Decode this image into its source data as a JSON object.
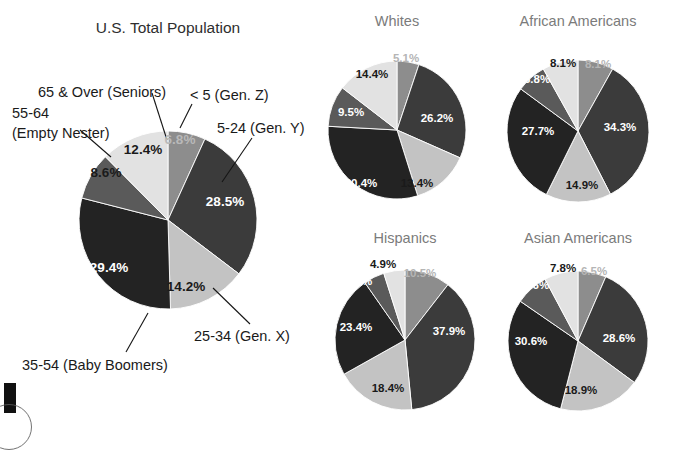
{
  "figure": {
    "kind": "pie-chart-panel",
    "background": "#ffffff"
  },
  "palette": {
    "gen_z": "#8d8d8d",
    "gen_y": "#3b3b3b",
    "gen_x": "#c3c3c3",
    "boomers": "#232323",
    "empty_nester": "#5a5a5a",
    "seniors": "#e2e2e2",
    "main_title": "#2e2e2e",
    "sub_title": "#7b7b7b",
    "label_dark": "#1a1a1a",
    "label_light": "#ffffff"
  },
  "titles": {
    "main": "U.S. Total Population",
    "whites": "Whites",
    "african_americans": "African Americans",
    "hispanics": "Hispanics",
    "asian_americans": "Asian Americans"
  },
  "callouts": {
    "seniors": "65 & Over (Seniors)",
    "empty_nester_line1": "55-64",
    "empty_nester_line2": "(Empty Nester)",
    "gen_z": "< 5 (Gen. Z)",
    "gen_y": "5-24 (Gen. Y)",
    "gen_x": "25-34 (Gen. X)",
    "boomers": "35-54 (Baby Boomers)"
  },
  "main_labels": {
    "gen_z": "6.8%",
    "gen_y": "28.5%",
    "gen_x": "14.2%",
    "boomers": "29.4%",
    "empty_nester": "8.6%",
    "seniors": "12.4%"
  },
  "whites_labels": {
    "gen_z": "5.1%",
    "gen_y": "26.2%",
    "gen_x": "13.4%",
    "boomers": "30.4%",
    "empty_nester": "9.5%",
    "seniors": "14.4%"
  },
  "african_labels": {
    "gen_z": "8.1%",
    "gen_y": "34.3%",
    "gen_x": "14.9%",
    "boomers": "27.7%",
    "empty_nester": "6.8%",
    "seniors": "8.1%"
  },
  "hispanic_labels": {
    "gen_z": "10.5%",
    "gen_y": "37.9%",
    "gen_x": "18.4%",
    "boomers": "23.4%",
    "empty_nester": "4.8%",
    "seniors": "4.9%"
  },
  "asian_labels": {
    "gen_z": "6.5%",
    "gen_y": "28.6%",
    "gen_x": "18.9%",
    "boomers": "30.6%",
    "empty_nester": "7.6%",
    "seniors": "7.8%"
  },
  "chart_data": [
    {
      "type": "pie",
      "title": "U.S. Total Population",
      "categories": [
        "< 5 (Gen. Z)",
        "5-24 (Gen. Y)",
        "25-34 (Gen. X)",
        "35-54 (Baby Boomers)",
        "55-64 (Empty Nester)",
        "65 & Over (Seniors)"
      ],
      "values": [
        6.8,
        28.5,
        14.2,
        29.4,
        8.6,
        12.4
      ],
      "unit": "percent",
      "labels": [
        "6.8%",
        "28.5%",
        "14.2%",
        "29.4%",
        "8.6%",
        "12.4%"
      ],
      "colors": [
        "#8d8d8d",
        "#3b3b3b",
        "#c3c3c3",
        "#232323",
        "#5a5a5a",
        "#e2e2e2"
      ],
      "start_angle_deg": 0,
      "direction": "clockwise",
      "legend": "none",
      "callouts_shown": true
    },
    {
      "type": "pie",
      "title": "Whites",
      "categories": [
        "< 5 (Gen. Z)",
        "5-24 (Gen. Y)",
        "25-34 (Gen. X)",
        "35-54 (Baby Boomers)",
        "55-64 (Empty Nester)",
        "65 & Over (Seniors)"
      ],
      "values": [
        5.1,
        26.2,
        13.4,
        30.4,
        9.5,
        14.4
      ],
      "unit": "percent",
      "labels": [
        "5.1%",
        "26.2%",
        "13.4%",
        "30.4%",
        "9.5%",
        "14.4%"
      ],
      "colors": [
        "#8d8d8d",
        "#3b3b3b",
        "#c3c3c3",
        "#232323",
        "#5a5a5a",
        "#e2e2e2"
      ],
      "start_angle_deg": 0,
      "direction": "clockwise",
      "legend": "none"
    },
    {
      "type": "pie",
      "title": "African Americans",
      "categories": [
        "< 5 (Gen. Z)",
        "5-24 (Gen. Y)",
        "25-34 (Gen. X)",
        "35-54 (Baby Boomers)",
        "55-64 (Empty Nester)",
        "65 & Over (Seniors)"
      ],
      "values": [
        8.1,
        34.3,
        14.9,
        27.7,
        6.8,
        8.1
      ],
      "unit": "percent",
      "labels": [
        "8.1%",
        "34.3%",
        "14.9%",
        "27.7%",
        "6.8%",
        "8.1%"
      ],
      "colors": [
        "#8d8d8d",
        "#3b3b3b",
        "#c3c3c3",
        "#232323",
        "#5a5a5a",
        "#e2e2e2"
      ],
      "start_angle_deg": 0,
      "direction": "clockwise",
      "legend": "none"
    },
    {
      "type": "pie",
      "title": "Hispanics",
      "categories": [
        "< 5 (Gen. Z)",
        "5-24 (Gen. Y)",
        "25-34 (Gen. X)",
        "35-54 (Baby Boomers)",
        "55-64 (Empty Nester)",
        "65 & Over (Seniors)"
      ],
      "values": [
        10.5,
        37.9,
        18.4,
        23.4,
        4.8,
        4.9
      ],
      "unit": "percent",
      "labels": [
        "10.5%",
        "37.9%",
        "18.4%",
        "23.4%",
        "4.8%",
        "4.9%"
      ],
      "colors": [
        "#8d8d8d",
        "#3b3b3b",
        "#c3c3c3",
        "#232323",
        "#5a5a5a",
        "#e2e2e2"
      ],
      "start_angle_deg": 0,
      "direction": "clockwise",
      "legend": "none"
    },
    {
      "type": "pie",
      "title": "Asian Americans",
      "categories": [
        "< 5 (Gen. Z)",
        "5-24 (Gen. Y)",
        "25-34 (Gen. X)",
        "35-54 (Baby Boomers)",
        "55-64 (Empty Nester)",
        "65 & Over (Seniors)"
      ],
      "values": [
        6.5,
        28.6,
        18.9,
        30.6,
        7.6,
        7.8
      ],
      "unit": "percent",
      "labels": [
        "6.5%",
        "28.6%",
        "18.9%",
        "30.6%",
        "7.6%",
        "7.8%"
      ],
      "colors": [
        "#8d8d8d",
        "#3b3b3b",
        "#c3c3c3",
        "#232323",
        "#5a5a5a",
        "#e2e2e2"
      ],
      "start_angle_deg": 0,
      "direction": "clockwise",
      "legend": "none"
    }
  ]
}
